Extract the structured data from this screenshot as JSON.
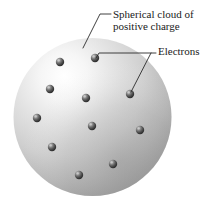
{
  "figure": {
    "background_color": "#ffffff",
    "width": 215,
    "height": 207
  },
  "labels": [
    {
      "id": "sphere-label",
      "name": "spherical-cloud-label",
      "line1": "Spherical cloud of",
      "line2": "positive charge",
      "x": 113,
      "y1": 18,
      "y2": 30,
      "color": "#1a1a1a",
      "font_size": 11
    },
    {
      "id": "electrons-label",
      "name": "electrons-label",
      "line1": "Electrons",
      "x": 158,
      "y1": 55,
      "color": "#1a1a1a",
      "font_size": 11
    }
  ],
  "leaders": [
    {
      "id": "leader-sphere",
      "name": "leader-line-sphere",
      "path": "M 111 14 L 100 14 L 83 48"
    },
    {
      "id": "leader-electrons-horizontal",
      "name": "leader-line-electrons",
      "path": "M 156 53 L 99 53 L 96 58"
    },
    {
      "id": "leader-electrons-branch",
      "name": "leader-line-electron-branch",
      "path": "M 151 53 L 131 92"
    }
  ],
  "sphere": {
    "name": "positive-charge-sphere",
    "center_x": 92.5,
    "center_y": 117,
    "radius": 79,
    "highlight_color": "#fdfdfd",
    "mid_color": "#d2d2d2",
    "edge_color": "#9a9a9a",
    "shadow_color": "#8e8e8e"
  },
  "electrons": {
    "name": "electron-particle",
    "radius": 4.2,
    "body_color": "#4a4a4a",
    "dark_color": "#2a2a2a",
    "highlight_color": "#c8c8c8",
    "count": 11,
    "positions": [
      {
        "cx": 95,
        "cy": 58,
        "label": "electron-1"
      },
      {
        "cx": 60,
        "cy": 62,
        "label": "electron-2"
      },
      {
        "cx": 50,
        "cy": 89,
        "label": "electron-3"
      },
      {
        "cx": 86,
        "cy": 98,
        "label": "electron-4"
      },
      {
        "cx": 130,
        "cy": 94,
        "label": "electron-5"
      },
      {
        "cx": 37,
        "cy": 118,
        "label": "electron-6"
      },
      {
        "cx": 92,
        "cy": 126,
        "label": "electron-7"
      },
      {
        "cx": 140,
        "cy": 130,
        "label": "electron-8"
      },
      {
        "cx": 52,
        "cy": 147,
        "label": "electron-9"
      },
      {
        "cx": 113,
        "cy": 164,
        "label": "electron-10"
      },
      {
        "cx": 79,
        "cy": 175,
        "label": "electron-11"
      }
    ]
  }
}
